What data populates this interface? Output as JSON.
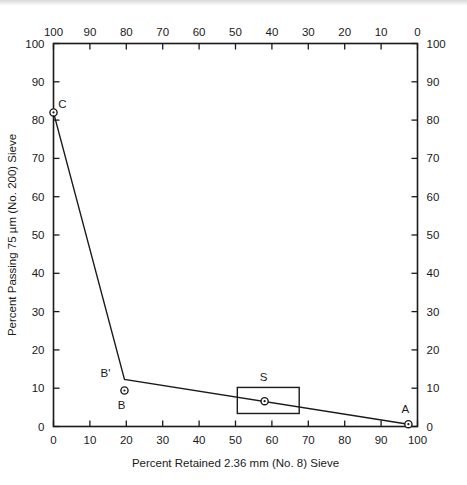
{
  "chart_data": {
    "type": "line",
    "title": "",
    "xlabel": "Percent Retained 2.36 mm (No. 8) Sieve",
    "ylabel": "Percent Passing 75 µm (No. 200) Sieve",
    "xlabel_top": "",
    "ylabel_right": "",
    "xlim": [
      0,
      100
    ],
    "ylim": [
      0,
      100
    ],
    "xlim_top": [
      100,
      0
    ],
    "ylim_right": [
      0,
      100
    ],
    "grid": false,
    "legend": "none",
    "x_ticks_bottom": [
      "0",
      "10",
      "20",
      "30",
      "40",
      "50",
      "60",
      "70",
      "80",
      "90",
      "100"
    ],
    "x_ticks_top": [
      "100",
      "90",
      "80",
      "70",
      "60",
      "50",
      "40",
      "30",
      "20",
      "10",
      "0"
    ],
    "y_ticks_left": [
      "0",
      "10",
      "20",
      "30",
      "40",
      "50",
      "60",
      "70",
      "80",
      "90",
      "100"
    ],
    "y_ticks_right": [
      "0",
      "10",
      "20",
      "30",
      "40",
      "50",
      "60",
      "70",
      "80",
      "90",
      "100"
    ],
    "series": [
      {
        "name": "gradation-path",
        "x": [
          0,
          19.5,
          97.5
        ],
        "y": [
          82,
          12.3,
          0.6
        ]
      }
    ],
    "points": [
      {
        "label": "C",
        "x": 0,
        "y": 82,
        "label_dx": 9,
        "label_dy": -4
      },
      {
        "label": "B'",
        "x": 19.5,
        "y": 12.3,
        "label_dx": -19,
        "label_dy": -2,
        "marker": false
      },
      {
        "label": "B",
        "x": 19.5,
        "y": 9.4,
        "label_dx": -3,
        "label_dy": 19
      },
      {
        "label": "S",
        "x": 58,
        "y": 6.6,
        "label_dx": -1,
        "label_dy": -20
      },
      {
        "label": "A",
        "x": 97.5,
        "y": 0.6,
        "label_dx": -3,
        "label_dy": -11
      }
    ],
    "boxes": [
      {
        "name": "S",
        "x0": 50.5,
        "x1": 67.5,
        "y0": 3.4,
        "y1": 10.2
      }
    ],
    "annotations": []
  },
  "colors": {
    "ink": "#1a1a1a",
    "background": "#ffffff",
    "top_strip": "#d8d8d8"
  }
}
